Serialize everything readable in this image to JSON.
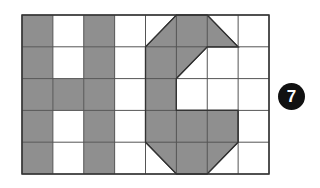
{
  "grid": {
    "cols": 8,
    "rows": 5,
    "x0": 22,
    "y0": 15,
    "x1": 269,
    "y1": 174,
    "fill_color": "#8f8f8f",
    "line_color": "#555555",
    "border_color": "#333333"
  },
  "shapes": {
    "letter_h_cells": [
      [
        0,
        0
      ],
      [
        2,
        0
      ],
      [
        0,
        1
      ],
      [
        2,
        1
      ],
      [
        0,
        2
      ],
      [
        1,
        2
      ],
      [
        2,
        2
      ],
      [
        0,
        3
      ],
      [
        2,
        3
      ],
      [
        0,
        4
      ],
      [
        2,
        4
      ]
    ],
    "letter_g_polygon": [
      [
        4,
        1
      ],
      [
        5,
        0
      ],
      [
        6,
        0
      ],
      [
        7,
        1
      ],
      [
        6,
        1
      ],
      [
        5,
        2
      ],
      [
        5,
        3
      ],
      [
        7,
        3
      ],
      [
        7,
        4
      ],
      [
        6,
        5
      ],
      [
        5,
        5
      ],
      [
        4,
        4
      ]
    ]
  },
  "badge": {
    "label": "7",
    "color": "#111111"
  }
}
